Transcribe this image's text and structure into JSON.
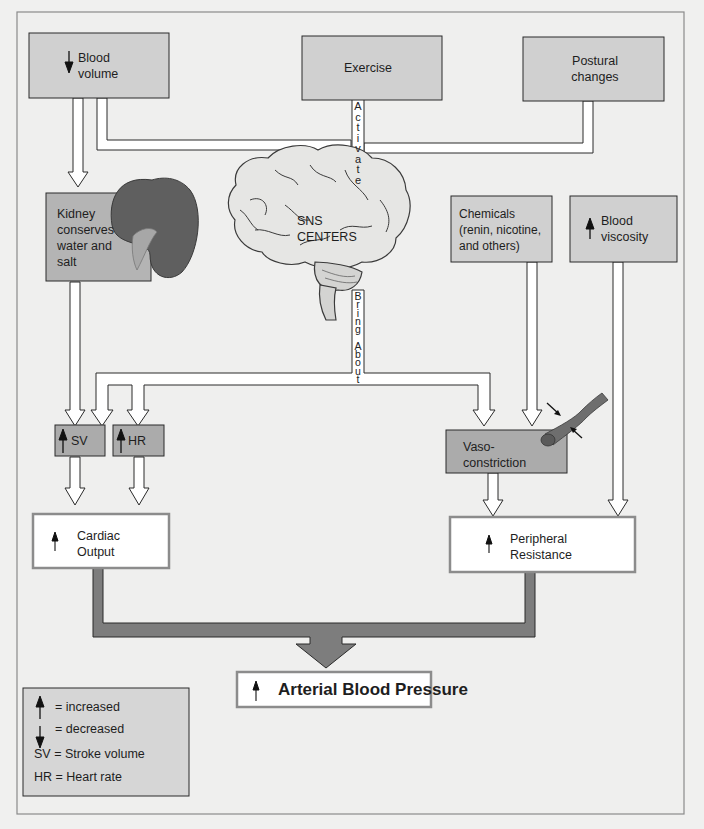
{
  "colors": {
    "background": "#f0f0ef",
    "frame_border": "#8a8a8a",
    "gray_box": "#cfcfcf",
    "dark_box": "#a9a9a9",
    "white_box": "#ffffff",
    "connector_dark": "#7a7a7a",
    "kidney": "#5f5f5f",
    "vessel": "#6e6e6e"
  },
  "boxes": {
    "blood_volume": {
      "indicator": "decreased",
      "line1": "Blood",
      "line2": "volume"
    },
    "exercise": {
      "label": "Exercise"
    },
    "postural": {
      "line1": "Postural",
      "line2": "changes"
    },
    "kidney": {
      "line1": "Kidney",
      "line2": "conserves",
      "line3": "water and",
      "line4": "salt"
    },
    "brain": {
      "line1": "SNS",
      "line2": "CENTERS"
    },
    "chemicals": {
      "line1": "Chemicals",
      "line2": "(renin, nicotine,",
      "line3": "and others)"
    },
    "blood_viscosity": {
      "indicator": "increased",
      "line1": "Blood",
      "line2": "viscosity"
    },
    "sv": {
      "indicator": "increased",
      "label": "SV"
    },
    "hr": {
      "indicator": "increased",
      "label": "HR"
    },
    "vasoconstriction": {
      "line1": "Vaso-",
      "line2": "constriction"
    },
    "cardiac_output": {
      "indicator": "increased",
      "line1": "Cardiac",
      "line2": "Output"
    },
    "peripheral_resistance": {
      "indicator": "increased",
      "line1": "Peripheral",
      "line2": "Resistance"
    },
    "arterial_bp": {
      "indicator": "increased",
      "label": "Arterial Blood Pressure"
    }
  },
  "connectors": {
    "activate": "A\nc\nt\ni\nv\na\nt\ne",
    "bring_about": "B\nr\ni\nn\ng\n\nA\nb\no\nu\nt"
  },
  "legend": {
    "increased": "= increased",
    "decreased": "= decreased",
    "sv": "SV = Stroke volume",
    "hr": "HR = Heart rate"
  }
}
